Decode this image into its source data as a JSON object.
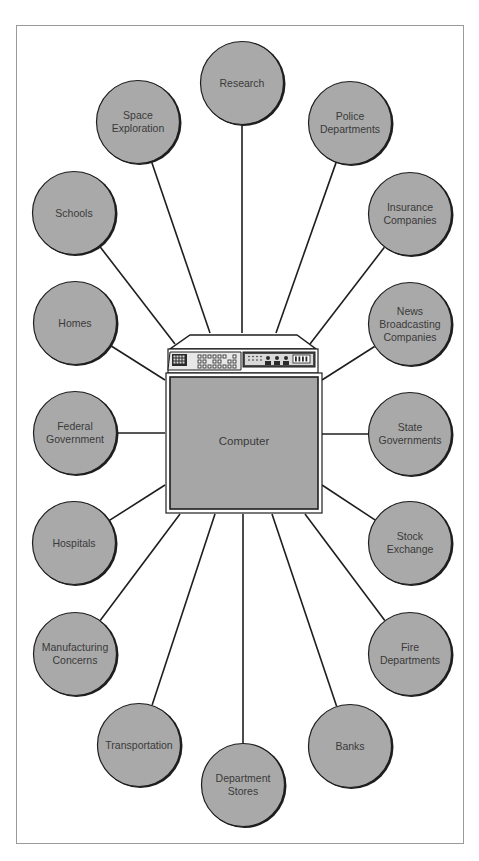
{
  "diagram": {
    "type": "hub-and-spoke",
    "hub": {
      "label": "Computer"
    },
    "colors": {
      "node_fill": "#a9a9a9",
      "node_border": "#1e1e1e",
      "connector": "#1e1e1e",
      "computer_panel": "#a6a6a6",
      "frame": "#9a9a9a"
    },
    "nodes": [
      {
        "id": "research",
        "label": "Research",
        "cx": 242,
        "cy": 83,
        "ex": 242,
        "ey": 333
      },
      {
        "id": "space-exploration",
        "label": "Space\nExploration",
        "cx": 138,
        "cy": 122,
        "ex": 210,
        "ey": 333
      },
      {
        "id": "police-departments",
        "label": "Police\nDepartments",
        "cx": 350,
        "cy": 123,
        "ex": 276,
        "ey": 333
      },
      {
        "id": "schools",
        "label": "Schools",
        "cx": 74,
        "cy": 213,
        "ex": 175,
        "ey": 344
      },
      {
        "id": "insurance-companies",
        "label": "Insurance\nCompanies",
        "cx": 410,
        "cy": 214,
        "ex": 310,
        "ey": 344
      },
      {
        "id": "homes",
        "label": "Homes",
        "cx": 75,
        "cy": 323,
        "ex": 165,
        "ey": 380
      },
      {
        "id": "news-broadcasting-companies",
        "label": "News\nBroadcasting\nCompanies",
        "cx": 410,
        "cy": 324,
        "ex": 322,
        "ey": 380
      },
      {
        "id": "federal-government",
        "label": "Federal\nGovernment",
        "cx": 75,
        "cy": 433,
        "ex": 165,
        "ey": 433
      },
      {
        "id": "state-governments",
        "label": "State\nGovernments",
        "cx": 410,
        "cy": 434,
        "ex": 322,
        "ey": 434
      },
      {
        "id": "hospitals",
        "label": "Hospitals",
        "cx": 74,
        "cy": 543,
        "ex": 165,
        "ey": 485
      },
      {
        "id": "stock-exchange",
        "label": "Stock\nExchange",
        "cx": 410,
        "cy": 543,
        "ex": 322,
        "ey": 485
      },
      {
        "id": "manufacturing-concerns",
        "label": "Manufacturing\nConcerns",
        "cx": 75,
        "cy": 654,
        "ex": 180,
        "ey": 514
      },
      {
        "id": "fire-departments",
        "label": "Fire\nDepartments",
        "cx": 410,
        "cy": 654,
        "ex": 305,
        "ey": 514
      },
      {
        "id": "transportation",
        "label": "Transportation",
        "cx": 139,
        "cy": 745,
        "ex": 215,
        "ey": 514
      },
      {
        "id": "banks",
        "label": "Banks",
        "cx": 350,
        "cy": 746,
        "ex": 272,
        "ey": 514
      },
      {
        "id": "department-stores",
        "label": "Department\nStores",
        "cx": 243,
        "cy": 785,
        "ex": 243,
        "ey": 514
      }
    ]
  }
}
